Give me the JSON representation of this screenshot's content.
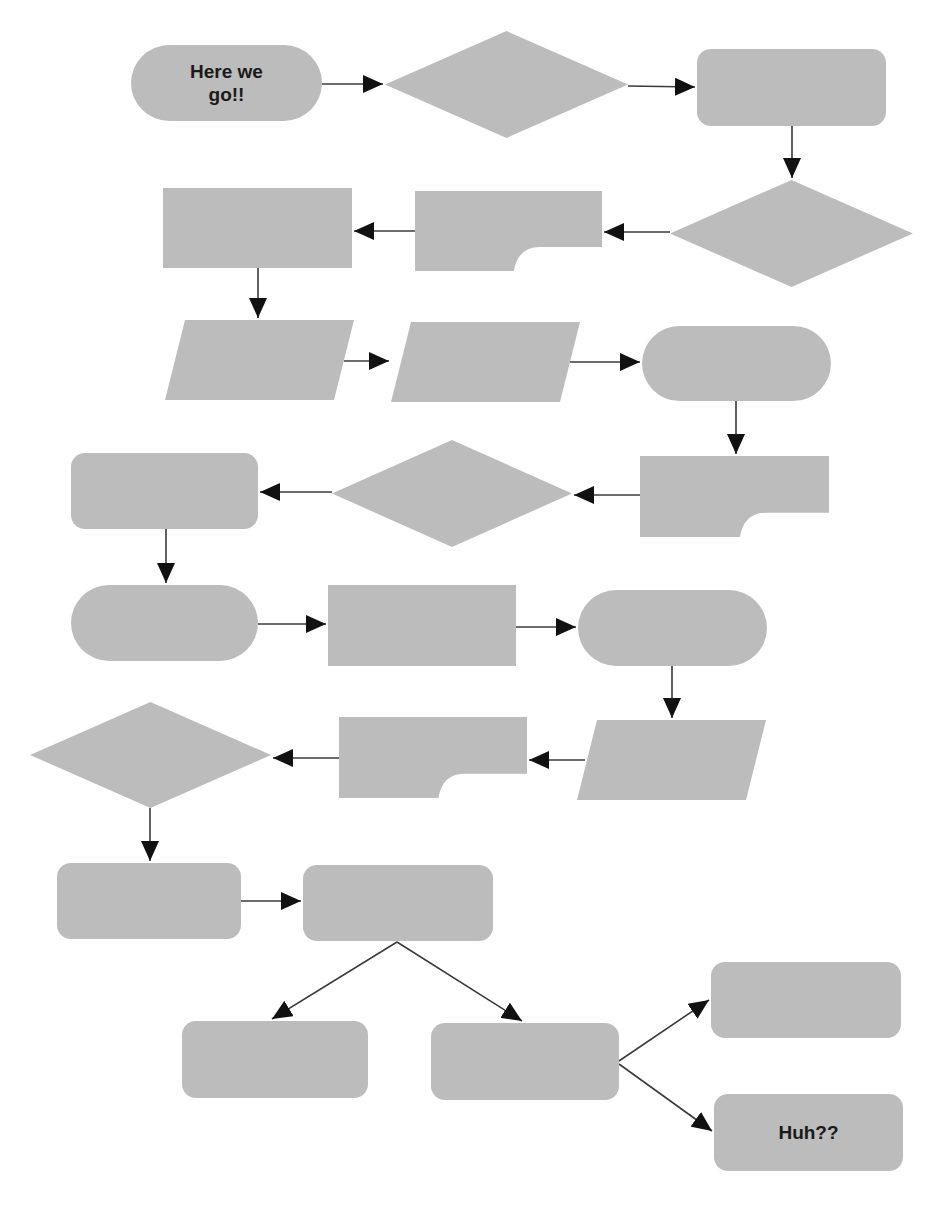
{
  "diagram": {
    "type": "flowchart",
    "colors": {
      "fill": "#bcbcbc",
      "line": "#3a3a3a",
      "arrowhead": "#111111",
      "text": "#1a1a1a",
      "background": "#ffffff"
    },
    "nodes": [
      {
        "id": "n1",
        "shape": "terminal",
        "x": 131,
        "y": 45,
        "w": 191,
        "h": 76,
        "label": "Here we go!!"
      },
      {
        "id": "n2",
        "shape": "diamond",
        "x": 385,
        "y": 31,
        "w": 243,
        "h": 107,
        "label": ""
      },
      {
        "id": "n3",
        "shape": "rounded-rect",
        "x": 697,
        "y": 49,
        "w": 189,
        "h": 77,
        "label": ""
      },
      {
        "id": "n4",
        "shape": "diamond",
        "x": 670,
        "y": 180,
        "w": 243,
        "h": 107,
        "label": ""
      },
      {
        "id": "n5",
        "shape": "card",
        "x": 415,
        "y": 191,
        "w": 187,
        "h": 80,
        "label": ""
      },
      {
        "id": "n6",
        "shape": "rect",
        "x": 163,
        "y": 188,
        "w": 189,
        "h": 80,
        "label": ""
      },
      {
        "id": "n7",
        "shape": "parallelogram",
        "x": 165,
        "y": 320,
        "w": 189,
        "h": 80,
        "label": ""
      },
      {
        "id": "n8",
        "shape": "parallelogram",
        "x": 391,
        "y": 322,
        "w": 189,
        "h": 80,
        "label": ""
      },
      {
        "id": "n9",
        "shape": "terminal",
        "x": 642,
        "y": 326,
        "w": 189,
        "h": 75,
        "label": ""
      },
      {
        "id": "n10",
        "shape": "card",
        "x": 640,
        "y": 456,
        "w": 189,
        "h": 81,
        "label": ""
      },
      {
        "id": "n11",
        "shape": "diamond",
        "x": 332,
        "y": 440,
        "w": 240,
        "h": 107,
        "label": ""
      },
      {
        "id": "n12",
        "shape": "rounded-rect",
        "x": 71,
        "y": 453,
        "w": 187,
        "h": 76,
        "label": ""
      },
      {
        "id": "n13",
        "shape": "terminal",
        "x": 71,
        "y": 585,
        "w": 187,
        "h": 76,
        "label": ""
      },
      {
        "id": "n14",
        "shape": "rect",
        "x": 328,
        "y": 585,
        "w": 188,
        "h": 81,
        "label": ""
      },
      {
        "id": "n15",
        "shape": "terminal",
        "x": 578,
        "y": 590,
        "w": 189,
        "h": 76,
        "label": ""
      },
      {
        "id": "n16",
        "shape": "parallelogram",
        "x": 577,
        "y": 720,
        "w": 189,
        "h": 80,
        "label": ""
      },
      {
        "id": "n17",
        "shape": "card",
        "x": 339,
        "y": 717,
        "w": 188,
        "h": 81,
        "label": ""
      },
      {
        "id": "n18",
        "shape": "diamond",
        "x": 30,
        "y": 702,
        "w": 241,
        "h": 106,
        "label": ""
      },
      {
        "id": "n19",
        "shape": "rounded-rect",
        "x": 57,
        "y": 863,
        "w": 184,
        "h": 76,
        "label": ""
      },
      {
        "id": "n20",
        "shape": "rounded-rect",
        "x": 303,
        "y": 865,
        "w": 190,
        "h": 76,
        "label": ""
      },
      {
        "id": "n21",
        "shape": "rounded-rect",
        "x": 182,
        "y": 1021,
        "w": 186,
        "h": 77,
        "label": ""
      },
      {
        "id": "n22",
        "shape": "rounded-rect",
        "x": 431,
        "y": 1023,
        "w": 188,
        "h": 77,
        "label": ""
      },
      {
        "id": "n23",
        "shape": "rounded-rect",
        "x": 711,
        "y": 962,
        "w": 190,
        "h": 76,
        "label": ""
      },
      {
        "id": "n24",
        "shape": "rounded-rect",
        "x": 714,
        "y": 1094,
        "w": 189,
        "h": 77,
        "label": "Huh??"
      }
    ],
    "edges": [
      {
        "from": "n1",
        "to": "n2",
        "x1": 322,
        "y1": 84,
        "x2": 383,
        "y2": 84
      },
      {
        "from": "n2",
        "to": "n3",
        "x1": 628,
        "y1": 86,
        "x2": 695,
        "y2": 87
      },
      {
        "from": "n3",
        "to": "n4",
        "x1": 792,
        "y1": 126,
        "x2": 792,
        "y2": 178
      },
      {
        "from": "n4",
        "to": "n5",
        "x1": 670,
        "y1": 232,
        "x2": 604,
        "y2": 232
      },
      {
        "from": "n5",
        "to": "n6",
        "x1": 415,
        "y1": 231,
        "x2": 354,
        "y2": 231
      },
      {
        "from": "n6",
        "to": "n7",
        "x1": 258,
        "y1": 268,
        "x2": 258,
        "y2": 318
      },
      {
        "from": "n7",
        "to": "n8",
        "x1": 344,
        "y1": 361,
        "x2": 389,
        "y2": 361
      },
      {
        "from": "n8",
        "to": "n9",
        "x1": 570,
        "y1": 362,
        "x2": 640,
        "y2": 362
      },
      {
        "from": "n9",
        "to": "n10",
        "x1": 736,
        "y1": 401,
        "x2": 736,
        "y2": 454
      },
      {
        "from": "n10",
        "to": "n11",
        "x1": 640,
        "y1": 495,
        "x2": 574,
        "y2": 495
      },
      {
        "from": "n11",
        "to": "n12",
        "x1": 332,
        "y1": 492,
        "x2": 260,
        "y2": 492
      },
      {
        "from": "n12",
        "to": "n13",
        "x1": 166,
        "y1": 529,
        "x2": 166,
        "y2": 583
      },
      {
        "from": "n13",
        "to": "n14",
        "x1": 258,
        "y1": 624,
        "x2": 326,
        "y2": 624
      },
      {
        "from": "n14",
        "to": "n15",
        "x1": 516,
        "y1": 627,
        "x2": 576,
        "y2": 627
      },
      {
        "from": "n15",
        "to": "n16",
        "x1": 672,
        "y1": 666,
        "x2": 672,
        "y2": 718
      },
      {
        "from": "n16",
        "to": "n17",
        "x1": 585,
        "y1": 760,
        "x2": 529,
        "y2": 760
      },
      {
        "from": "n17",
        "to": "n18",
        "x1": 339,
        "y1": 758,
        "x2": 273,
        "y2": 758
      },
      {
        "from": "n18",
        "to": "n19",
        "x1": 150,
        "y1": 808,
        "x2": 150,
        "y2": 861
      },
      {
        "from": "n19",
        "to": "n20",
        "x1": 241,
        "y1": 901,
        "x2": 301,
        "y2": 901
      },
      {
        "from": "n20",
        "to": "n21",
        "x1": 397,
        "y1": 942,
        "x2": 272,
        "y2": 1019
      },
      {
        "from": "n20",
        "to": "n22",
        "x1": 397,
        "y1": 942,
        "x2": 522,
        "y2": 1021
      },
      {
        "from": "n22",
        "to": "n23",
        "x1": 619,
        "y1": 1061,
        "x2": 709,
        "y2": 1000
      },
      {
        "from": "n22",
        "to": "n24",
        "x1": 619,
        "y1": 1064,
        "x2": 712,
        "y2": 1131
      }
    ]
  }
}
